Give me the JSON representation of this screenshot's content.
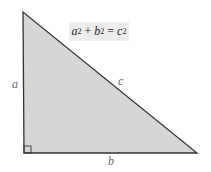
{
  "diagram": {
    "formula": {
      "a": "a",
      "b": "b",
      "c": "c",
      "exp": "2",
      "plus": "+",
      "equals": "="
    },
    "labels": {
      "side_a": "a",
      "side_b": "b",
      "side_c": "c"
    },
    "vertices": {
      "top": [
        23,
        12
      ],
      "bottom_left": [
        24,
        153
      ],
      "bottom_right": [
        197,
        153
      ]
    },
    "colors": {
      "fill": "#d6d6d6",
      "stroke": "#333333",
      "formula_bg": "#ededed",
      "label": "#666666"
    }
  }
}
